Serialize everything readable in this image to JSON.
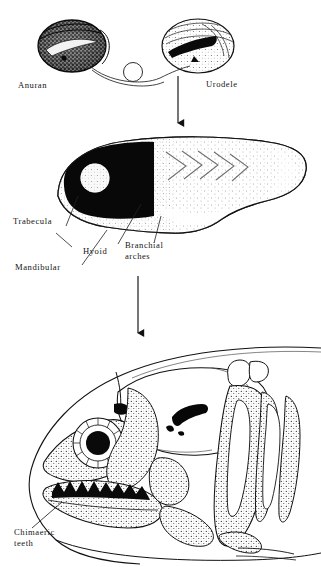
{
  "figure": {
    "background_color": "#ffffff",
    "ink_color": "#111111",
    "panels": [
      {
        "id": "panel-embryos",
        "name": "donor-host-embryos",
        "items": [
          {
            "name": "anuran-embryo",
            "label": "Anuran",
            "shading": "dark-stippled",
            "feature": "pale crescent neural fold band"
          },
          {
            "name": "urodele-embryo",
            "label": "Urodele",
            "shading": "light-stippled",
            "feature": "dark transplanted neural crest bar"
          },
          {
            "name": "graft-connector",
            "label": "",
            "shading": "line",
            "feature": "curve with small circle marking transplanted tissue"
          }
        ]
      },
      {
        "id": "panel-larva",
        "name": "pharyngeal-arch-larva",
        "items": [
          {
            "name": "larva-body",
            "label": "",
            "shading": "stippled",
            "feature": "chevron myotomes"
          },
          {
            "name": "eye-vesicle",
            "label": "",
            "shading": "light",
            "feature": "pale circular eye in black head region"
          }
        ]
      },
      {
        "id": "panel-skull",
        "name": "chimaeric-skull",
        "items": [
          {
            "name": "sclerotic-ring",
            "label": "",
            "shading": "line",
            "feature": "radial ticks around black pupil"
          },
          {
            "name": "branchial-basket",
            "label": "",
            "shading": "stippled",
            "feature": "elongate gill arch bars"
          },
          {
            "name": "hyomandibular-mark",
            "label": "",
            "shading": "solid-black",
            "feature": "hook-shaped black marking"
          }
        ]
      }
    ]
  },
  "labels": {
    "anuran": "Anuran",
    "urodele": "Urodele",
    "trabecula": "Trabecula",
    "mandibular": "Mandibular",
    "hyoid": "Hyoid",
    "branchial_arches_line1": "Branchial",
    "branchial_arches_line2": "arches",
    "chimaeric_line1": "Chimaeric",
    "chimaeric_line2": "teeth"
  },
  "arrows": [
    {
      "name": "arrow-embryo-to-larva",
      "direction": "down",
      "from": "urodele-embryo",
      "to": "pharyngeal-arch-larva"
    },
    {
      "name": "arrow-larva-to-skull",
      "direction": "down",
      "from": "pharyngeal-arch-larva",
      "to": "chimaeric-skull"
    }
  ]
}
